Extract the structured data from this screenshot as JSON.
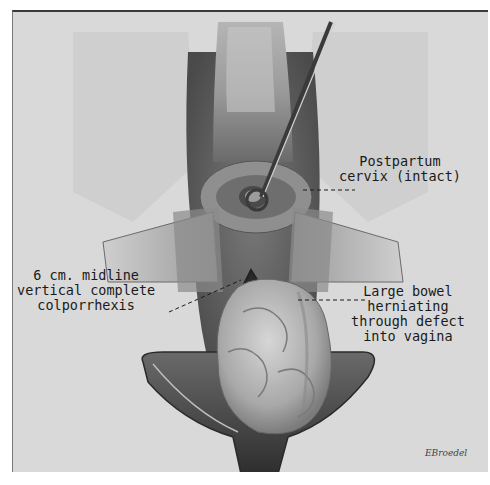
{
  "illustration": {
    "subject": "surgical view of vaginal vault with retractors showing colporrhexis and herniating bowel",
    "colors": {
      "background_paper": "#d9d9d9",
      "tissue_dark": "#5a5a5a",
      "tissue_mid": "#8a8a8a",
      "tissue_light": "#c4c4c4",
      "ink": "#1a1a1a"
    }
  },
  "labels": {
    "cervix": {
      "line1": "Postpartum",
      "line2": "cervix (intact)"
    },
    "colporrhexis": {
      "line1": "6 cm. midline",
      "line2": "vertical complete",
      "line3": "colporrhexis"
    },
    "bowel": {
      "line1": "Large bowel",
      "line2": "herniating",
      "line3": "through defect",
      "line4": "into vagina"
    }
  },
  "signature": "EBroedel"
}
